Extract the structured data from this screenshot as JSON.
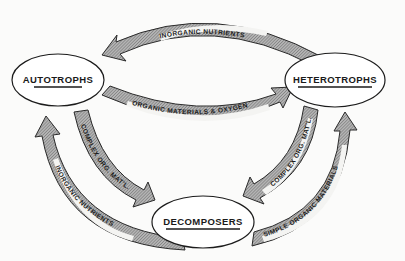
{
  "diagram": {
    "type": "cycle",
    "nodes": [
      {
        "id": "autotrophs",
        "label": "AUTOTROPHS",
        "cx": 58,
        "cy": 80
      },
      {
        "id": "heterotrophs",
        "label": "HETEROTROPHS",
        "cx": 335,
        "cy": 80
      },
      {
        "id": "decomposers",
        "label": "DECOMPOSERS",
        "cx": 203,
        "cy": 222
      }
    ],
    "arrows": [
      {
        "id": "top",
        "from": "heterotrophs",
        "to": "autotrophs",
        "label": "INORGANIC  NUTRIENTS"
      },
      {
        "id": "middle",
        "from": "autotrophs",
        "to": "heterotrophs",
        "label": "ORGANIC MATERIALS  &  OXYGEN"
      },
      {
        "id": "left-inner",
        "from": "autotrophs",
        "to": "decomposers",
        "label": "COMPLEX ORG. MAT'L."
      },
      {
        "id": "left-outer",
        "from": "decomposers",
        "to": "autotrophs",
        "label": "INORGANIC NUTRIENTS"
      },
      {
        "id": "right-inner",
        "from": "heterotrophs",
        "to": "decomposers",
        "label": "COMPLEX ORG. MAT'L."
      },
      {
        "id": "right-outer",
        "from": "decomposers",
        "to": "heterotrophs",
        "label": "SIMPLE ORGANIC MATERIALS"
      }
    ],
    "colors": {
      "background": "#fbfbfa",
      "arrow_fill": "#8c8c8c",
      "outline": "#1c1c1c",
      "label_band": "#f4f4f2"
    }
  }
}
